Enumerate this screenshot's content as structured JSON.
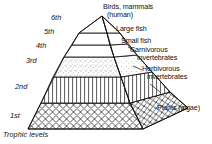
{
  "figure": {
    "type": "ecological-pyramid-diagram",
    "caption": "Trophic levels",
    "colors": {
      "stroke": "#111111",
      "background": "#ffffff",
      "stipple": "#7a7a7a"
    }
  },
  "trophic_levels": [
    {
      "id": "1st",
      "ordinal_label": "1st",
      "organisms": "Plants (algae)",
      "pattern": "diamond-crosshatch"
    },
    {
      "id": "2nd",
      "ordinal_label": "2nd",
      "organisms": "Herbivorous\ninvertebrates",
      "pattern": "vertical-lines"
    },
    {
      "id": "3rd",
      "ordinal_label": "3rd",
      "organisms": "Carnivorous\ninvertebrates",
      "pattern": "stipple"
    },
    {
      "id": "4th",
      "ordinal_label": "4th",
      "organisms": "Small fish",
      "pattern": "blank"
    },
    {
      "id": "5th",
      "ordinal_label": "5th",
      "organisms": "Large fish",
      "pattern": "blank"
    },
    {
      "id": "6th",
      "ordinal_label": "6th",
      "organisms": "Birds, mammals\n(human)",
      "pattern": "blank"
    }
  ],
  "level_labels": {
    "l1": "1st",
    "l2": "2nd",
    "l3": "3rd",
    "l4": "4th",
    "l5": "5th",
    "l6": "6th"
  },
  "organism_labels": {
    "birds_line1": "Birds, mammals",
    "birds_line2": "(human)",
    "large_fish": "Large fish",
    "small_fish": "Small fish",
    "carnivorous_line1": "Carnivorous",
    "carnivorous_line2": "invertebrates",
    "herbivorous_line1": "Herbivorous",
    "herbivorous_line2": "invertebrates",
    "plants": "Plants (algae)"
  }
}
